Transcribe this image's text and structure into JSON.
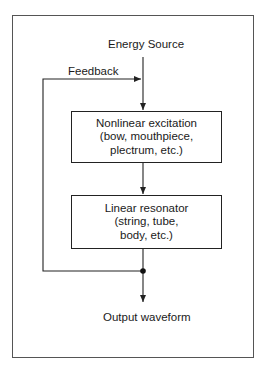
{
  "diagram": {
    "title": "",
    "nodes": {
      "energy_source": {
        "label": "Energy Source"
      },
      "feedback": {
        "label": "Feedback"
      },
      "excitation": {
        "title": "Nonlinear excitation",
        "line2": "(bow, mouthpiece,",
        "line3": "plectrum, etc.)"
      },
      "resonator": {
        "title": "Linear resonator",
        "line2": "(string, tube,",
        "line3": "body, etc.)"
      },
      "output": {
        "label": "Output waveform"
      }
    },
    "edges": [
      {
        "from": "energy_source",
        "to": "excitation"
      },
      {
        "from": "excitation",
        "to": "resonator"
      },
      {
        "from": "resonator",
        "to": "output"
      },
      {
        "from": "resonator",
        "to": "excitation",
        "label": "Feedback"
      }
    ],
    "colors": {
      "line": "#222222",
      "frame": "#555555",
      "background": "#ffffff"
    }
  }
}
